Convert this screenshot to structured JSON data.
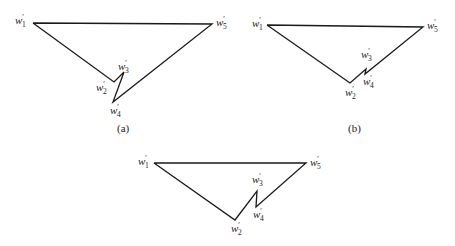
{
  "figure": {
    "panels": [
      {
        "id": "a",
        "caption": "(a)",
        "caption_pos": [
          117,
          132
        ],
        "vertices": {
          "w1": [
            33,
            23
          ],
          "w2": [
            114,
            82
          ],
          "w3": [
            124,
            72
          ],
          "w4": [
            113,
            102
          ],
          "w5": [
            212,
            24
          ]
        },
        "labels": [
          {
            "text": "w",
            "prime": "′",
            "sub": "1",
            "x": 15,
            "y": 24
          },
          {
            "text": "w",
            "prime": "′",
            "sub": "5",
            "x": 216,
            "y": 26
          },
          {
            "text": "w",
            "prime": "′",
            "sub": "3",
            "x": 118,
            "y": 70
          },
          {
            "text": "w",
            "prime": "′",
            "sub": "2",
            "x": 96,
            "y": 91
          },
          {
            "text": "w",
            "prime": "′",
            "sub": "4",
            "x": 110,
            "y": 114
          }
        ]
      },
      {
        "id": "b",
        "caption": "(b)",
        "caption_pos": [
          348,
          132
        ],
        "vertices": {
          "w1": [
            267,
            25
          ],
          "w2": [
            350,
            83
          ],
          "w3": [
            366,
            69
          ],
          "w4": [
            365,
            74
          ],
          "w5": [
            423,
            27
          ]
        },
        "labels": [
          {
            "text": "w",
            "prime": "′",
            "sub": "1",
            "x": 252,
            "y": 27
          },
          {
            "text": "w",
            "prime": "′",
            "sub": "5",
            "x": 427,
            "y": 29
          },
          {
            "text": "w",
            "prime": "′",
            "sub": "3",
            "x": 361,
            "y": 58
          },
          {
            "text": "w",
            "prime": "′",
            "sub": "4",
            "x": 363,
            "y": 85
          },
          {
            "text": "w",
            "prime": "′",
            "sub": "2",
            "x": 345,
            "y": 96
          }
        ]
      },
      {
        "id": "c",
        "caption": "",
        "vertices": {
          "w1": [
            154,
            163
          ],
          "w2": [
            235,
            220
          ],
          "w3": [
            257,
            191
          ],
          "w4": [
            256,
            207
          ],
          "w5": [
            306,
            163
          ]
        },
        "labels": [
          {
            "text": "w",
            "prime": "′",
            "sub": "1",
            "x": 138,
            "y": 165
          },
          {
            "text": "w",
            "prime": "′",
            "sub": "5",
            "x": 310,
            "y": 166
          },
          {
            "text": "w",
            "prime": "′",
            "sub": "3",
            "x": 252,
            "y": 183
          },
          {
            "text": "w",
            "prime": "′",
            "sub": "4",
            "x": 253,
            "y": 218
          },
          {
            "text": "w",
            "prime": "′",
            "sub": "2",
            "x": 231,
            "y": 232
          }
        ]
      }
    ],
    "edge_order": [
      "w1",
      "w5",
      "w4",
      "w3",
      "w2",
      "w1"
    ]
  }
}
